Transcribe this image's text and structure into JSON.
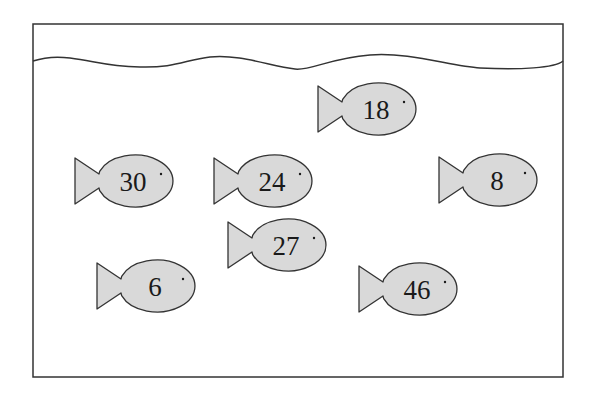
{
  "tank": {
    "border_color": "#333333",
    "fill_color": "#d9d9d9"
  },
  "fish": [
    {
      "id": "fish-18",
      "number": "18",
      "x": 318,
      "cy": 109
    },
    {
      "id": "fish-30",
      "number": "30",
      "x": 75,
      "cy": 181
    },
    {
      "id": "fish-24",
      "number": "24",
      "x": 214,
      "cy": 181
    },
    {
      "id": "fish-8",
      "number": "8",
      "x": 439,
      "cy": 180
    },
    {
      "id": "fish-27",
      "number": "27",
      "x": 228,
      "cy": 245
    },
    {
      "id": "fish-6",
      "number": "6",
      "x": 97,
      "cy": 286
    },
    {
      "id": "fish-46",
      "number": "46",
      "x": 359,
      "cy": 289
    }
  ]
}
